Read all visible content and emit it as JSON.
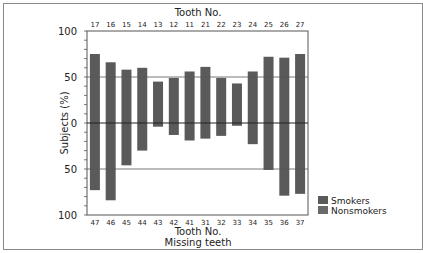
{
  "chart_data": {
    "type": "bar",
    "layout": "mirrored-vertical",
    "top_axis_title": "Tooth No.",
    "bottom_axis_title": "Tooth No.",
    "bottom_axis_subtitle": "Missing teeth",
    "ylabel": "Subjects (%)",
    "y_ticks_top": [
      "100",
      "50",
      "0"
    ],
    "y_ticks_bottom": [
      "50",
      "100"
    ],
    "ylim_top": [
      0,
      100
    ],
    "ylim_bottom": [
      0,
      100
    ],
    "reference_lines": [
      50,
      0,
      -50
    ],
    "top_categories": [
      "17",
      "16",
      "15",
      "14",
      "13",
      "12",
      "11",
      "21",
      "22",
      "23",
      "24",
      "25",
      "26",
      "27"
    ],
    "bottom_categories": [
      "47",
      "46",
      "45",
      "44",
      "43",
      "42",
      "41",
      "31",
      "32",
      "33",
      "34",
      "35",
      "36",
      "37"
    ],
    "top_values": [
      75,
      66,
      58,
      60,
      45,
      49,
      56,
      61,
      49,
      43,
      56,
      72,
      71,
      75
    ],
    "bottom_values": [
      73,
      84,
      46,
      30,
      4,
      13,
      19,
      17,
      14,
      3,
      23,
      51,
      79,
      77
    ],
    "legend": [
      {
        "name": "Smokers",
        "color": "#5a5a5a"
      },
      {
        "name": "Nonsmokers",
        "color": "#6a6a6a"
      }
    ],
    "legend_position": "bottom-right",
    "bar_color": "#5a5a5a"
  }
}
